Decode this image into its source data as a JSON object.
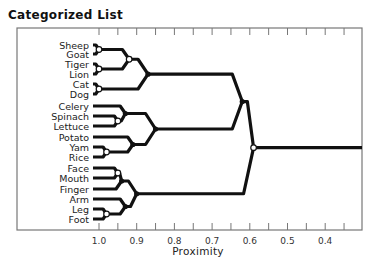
{
  "title": "Categorized List",
  "chart_data": {
    "type": "dendrogram",
    "title": "Categorized List",
    "xlabel": "Proximity",
    "ylabel": "",
    "x_axis": {
      "reversed": true,
      "range": [
        1.06,
        0.34
      ],
      "ticks": [
        1.0,
        0.9,
        0.8,
        0.7,
        0.6,
        0.5,
        0.4
      ],
      "tick_labels": [
        "1.0",
        "0.9",
        "0.8",
        "0.7",
        "0.6",
        "0.5",
        "0.4"
      ],
      "minor_ticks": [
        0.95,
        0.85,
        0.75,
        0.65,
        0.55,
        0.45,
        0.35
      ]
    },
    "grid": false,
    "leaves": [
      "Sheep",
      "Goat",
      "Tiger",
      "Lion",
      "Cat",
      "Dog",
      "Celery",
      "Spinach",
      "Lettuce",
      "Potato",
      "Yam",
      "Rice",
      "Face",
      "Mouth",
      "Finger",
      "Arm",
      "Leg",
      "Foot"
    ],
    "merges": [
      {
        "id": "sheep_goat",
        "children": [
          "Sheep",
          "Goat"
        ],
        "proximity": 1.0,
        "marker": "open"
      },
      {
        "id": "tiger_lion",
        "children": [
          "Tiger",
          "Lion"
        ],
        "proximity": 1.0,
        "marker": "open"
      },
      {
        "id": "cat_dog",
        "children": [
          "Cat",
          "Dog"
        ],
        "proximity": 1.0,
        "marker": "open"
      },
      {
        "id": "farm_wild",
        "children": [
          "sheep_goat",
          "tiger_lion"
        ],
        "proximity": 0.92,
        "marker": "open"
      },
      {
        "id": "animals",
        "children": [
          "farm_wild",
          "cat_dog"
        ],
        "proximity": 0.87,
        "marker": "filled"
      },
      {
        "id": "spinach_lettuce",
        "children": [
          "Spinach",
          "Lettuce"
        ],
        "proximity": 0.95,
        "marker": "open"
      },
      {
        "id": "greens",
        "children": [
          "Celery",
          "spinach_lettuce"
        ],
        "proximity": 0.93,
        "marker": "filled"
      },
      {
        "id": "yam_rice",
        "children": [
          "Yam",
          "Rice"
        ],
        "proximity": 0.98,
        "marker": "open"
      },
      {
        "id": "starches",
        "children": [
          "Potato",
          "yam_rice"
        ],
        "proximity": 0.91,
        "marker": "filled"
      },
      {
        "id": "foods",
        "children": [
          "greens",
          "starches"
        ],
        "proximity": 0.85,
        "marker": "filled"
      },
      {
        "id": "face_mouth",
        "children": [
          "Face",
          "Mouth"
        ],
        "proximity": 0.95,
        "marker": "open"
      },
      {
        "id": "face_parts",
        "children": [
          "face_mouth",
          "Finger"
        ],
        "proximity": 0.94,
        "marker": "filled"
      },
      {
        "id": "leg_foot",
        "children": [
          "Leg",
          "Foot"
        ],
        "proximity": 0.98,
        "marker": "open"
      },
      {
        "id": "limbs",
        "children": [
          "Arm",
          "leg_foot"
        ],
        "proximity": 0.93,
        "marker": "filled"
      },
      {
        "id": "body_parts",
        "children": [
          "face_parts",
          "limbs"
        ],
        "proximity": 0.9,
        "marker": "filled"
      },
      {
        "id": "living_food",
        "children": [
          "animals",
          "foods"
        ],
        "proximity": 0.62,
        "marker": "filled"
      },
      {
        "id": "root",
        "children": [
          "living_food",
          "body_parts"
        ],
        "proximity": 0.59,
        "marker": "open"
      }
    ],
    "root_extends_to": 0.34
  },
  "geometry": {
    "frame": {
      "x": 17,
      "y": 28,
      "w": 345,
      "h": 202
    },
    "leaf_y": [
      45,
      54,
      64,
      74,
      84,
      94,
      106,
      116,
      126,
      137,
      147,
      157,
      168,
      178,
      189,
      199,
      209,
      219
    ],
    "x_at_1": 99,
    "px_per_unit": 377,
    "leaf_x": 93
  }
}
